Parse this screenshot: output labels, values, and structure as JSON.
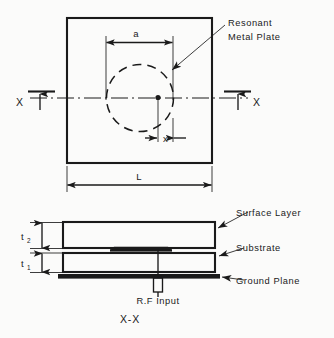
{
  "figure": {
    "type": "engineering-diagram",
    "background_color": "#fbfbfa",
    "line_color": "#1a1a1a"
  },
  "plan_view": {
    "outer_plate": {
      "shape": "square",
      "dimension_label": "L"
    },
    "resonant_element": {
      "shape": "circle-dashed",
      "diameter_label": "a",
      "callout_label_line1": "Resonant",
      "callout_label_line2": "Metal Plate"
    },
    "feed_offset": {
      "label": "x",
      "description": "offset of feed point from circle center"
    },
    "section_markers": {
      "left_label": "X",
      "right_label": "X"
    }
  },
  "cross_section": {
    "title": "X-X",
    "thickness_labels": [
      {
        "base": "t",
        "subscript": "2",
        "layer": "surface layer"
      },
      {
        "base": "t",
        "subscript": "1",
        "layer": "substrate"
      }
    ],
    "layer_callouts": [
      "Surface Layer",
      "Substrate",
      "Ground Plane"
    ],
    "feed_label": "R.F Input"
  }
}
